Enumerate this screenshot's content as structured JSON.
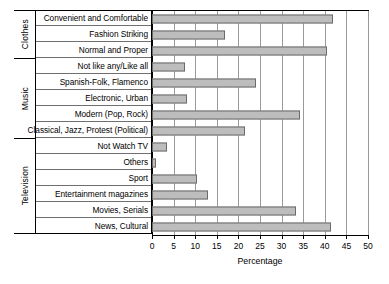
{
  "chart_data": {
    "type": "bar",
    "orientation": "horizontal",
    "title": "",
    "xlabel": "Percentage",
    "ylabel": "",
    "xlim": [
      0,
      50
    ],
    "xticks": [
      0,
      5,
      10,
      15,
      20,
      25,
      30,
      35,
      40,
      45,
      50
    ],
    "grid": true,
    "legend": "none",
    "bar_color": "#bdbdbd",
    "bar_border_color": "#6b6b6b",
    "groups": [
      {
        "name": "Clothes",
        "categories": [
          "Convenient and Comfortable",
          "Fashion Striking",
          "Normal and Proper"
        ],
        "values": [
          42,
          17,
          40.5
        ]
      },
      {
        "name": "Music",
        "categories": [
          "Not like any/Like all",
          "Spanish-Folk, Flamenco",
          "Electronic, Urban",
          "Modern (Pop, Rock)",
          "Classical, Jazz, Protest (Political)"
        ],
        "values": [
          7.6,
          24,
          8.1,
          34.2,
          21.5
        ]
      },
      {
        "name": "Television",
        "categories": [
          "Not  Watch TV",
          "Others",
          "Sport",
          "Entertainment magazines",
          "Movies, Serials",
          "News, Cultural"
        ],
        "values": [
          3.5,
          1,
          10.5,
          13,
          33.4,
          41.5
        ]
      }
    ],
    "categories": [
      "Convenient and Comfortable",
      "Fashion Striking",
      "Normal and Proper",
      "Not like any/Like all",
      "Spanish-Folk, Flamenco",
      "Electronic, Urban",
      "Modern (Pop, Rock)",
      "Classical, Jazz, Protest (Political)",
      "Not  Watch TV",
      "Others",
      "Sport",
      "Entertainment magazines",
      "Movies, Serials",
      "News, Cultural"
    ],
    "values": [
      42,
      17,
      40.5,
      7.6,
      24,
      8.1,
      34.2,
      21.5,
      3.5,
      1,
      10.5,
      13,
      33.4,
      41.5
    ]
  }
}
